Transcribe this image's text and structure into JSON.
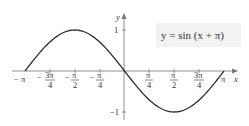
{
  "chart_data": {
    "type": "line",
    "title": "",
    "equation_label": "y = sin (x + π)",
    "xlabel": "x",
    "ylabel": "y",
    "xlim": [
      -3.14159,
      3.14159
    ],
    "ylim": [
      -1,
      1
    ],
    "grid": false,
    "legend": "inline label box, upper right",
    "x_ticks": [
      {
        "value": -3.14159,
        "label": "−π"
      },
      {
        "value": -2.35619,
        "label": "−3π/4"
      },
      {
        "value": -1.5708,
        "label": "−π/2"
      },
      {
        "value": -0.7854,
        "label": "−π/4"
      },
      {
        "value": 0.7854,
        "label": "π/4"
      },
      {
        "value": 1.5708,
        "label": "π/2"
      },
      {
        "value": 2.35619,
        "label": "3π/4"
      },
      {
        "value": 3.14159,
        "label": "π"
      }
    ],
    "y_ticks": [
      {
        "value": 1,
        "label": "1"
      },
      {
        "value": -1,
        "label": "−1"
      }
    ],
    "series": [
      {
        "name": "y = sin (x + π)",
        "x": [
          -3.14159,
          -2.35619,
          -1.5708,
          -0.7854,
          0,
          0.7854,
          1.5708,
          2.35619,
          3.14159
        ],
        "values": [
          0,
          0.7071,
          1,
          0.7071,
          0,
          -0.7071,
          -1,
          -0.7071,
          0
        ]
      }
    ]
  },
  "labels": {
    "y_axis": "y",
    "x_axis": "x",
    "equation": "y = sin (x + π)",
    "y_one": "1",
    "y_neg_one": "−1",
    "neg_pi": "− π",
    "neg_3pi4_num": "3π",
    "neg_pi2_num": "π",
    "neg_pi4_num": "π",
    "pi4_num": "π",
    "pi2_num": "π",
    "3pi4_num": "3π",
    "den4": "4",
    "den2": "2",
    "pi": "π",
    "minus": "−"
  },
  "colors": {
    "curve": "#2b2b2b",
    "axis": "#777777",
    "label_box": "#f2f2f2"
  }
}
